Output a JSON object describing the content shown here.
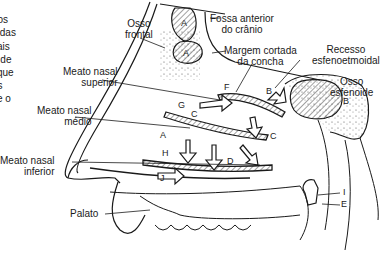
{
  "side_text": [
    "r",
    "dos",
    "s das",
    "cais",
    "e de",
    "l que",
    "os",
    "l e o",
    "s."
  ],
  "labels": {
    "osso_frontal": [
      "Osso",
      "frontal"
    ],
    "fossa_anterior": [
      "Fossa anterior",
      "do crânio"
    ],
    "margem_cortada": [
      "Margem cortada",
      "da concha"
    ],
    "recesso": [
      "Recesso",
      "esfenoetmoidal"
    ],
    "osso_esfenoide": [
      "Osso",
      "esfenoide"
    ],
    "meato_superior": [
      "Meato nasal",
      "superior"
    ],
    "meato_medio": [
      "Meato nasal",
      "médio"
    ],
    "meato_inferior": [
      "Meato nasal",
      "inferior"
    ],
    "palato": "Palato"
  },
  "letters": [
    "A",
    "A",
    "B",
    "B",
    "C",
    "C",
    "C",
    "D",
    "E",
    "F",
    "G",
    "H",
    "I",
    "J"
  ],
  "colors": {
    "ink": "#1a1a1a",
    "background": "#ffffff",
    "hatch": "#444444"
  }
}
